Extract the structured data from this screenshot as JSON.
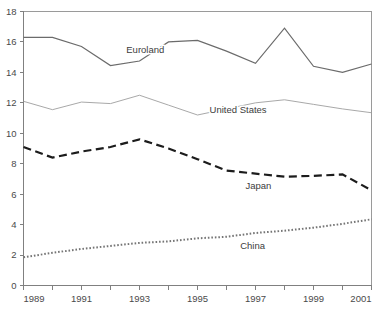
{
  "chart_data": {
    "type": "line",
    "title": "",
    "subtitle": "",
    "xlabel": "",
    "ylabel": "",
    "x": [
      1989,
      1990,
      1991,
      1992,
      1993,
      1994,
      1995,
      1996,
      1997,
      1998,
      1999,
      2000,
      2001
    ],
    "xlim": [
      1989,
      2001
    ],
    "ylim": [
      0,
      18
    ],
    "ytick_values": [
      0,
      2,
      4,
      6,
      8,
      10,
      12,
      14,
      16,
      18
    ],
    "ytick_labels": [
      "0",
      "2",
      "4",
      "6",
      "8",
      "10",
      "12",
      "14",
      "16",
      "18"
    ],
    "xtick_values": [
      1989,
      1990,
      1991,
      1992,
      1993,
      1994,
      1995,
      1996,
      1997,
      1998,
      1999,
      2000,
      2001
    ],
    "xtick_labels": [
      "1989",
      "",
      "1991",
      "",
      "1993",
      "",
      "1995",
      "",
      "1997",
      "",
      "1999",
      "",
      "2001"
    ],
    "grid": false,
    "legend_position": "inline-annotations",
    "series": [
      {
        "name": "Euroland",
        "style": "solid",
        "color": "#6b6b6b",
        "width": 1.2,
        "label_x": 1993.2,
        "label_y": 15.25,
        "values": [
          16.3,
          16.3,
          15.7,
          14.45,
          14.75,
          16.0,
          16.1,
          15.4,
          14.6,
          16.9,
          14.4,
          14.0,
          14.55
        ]
      },
      {
        "name": "United States",
        "style": "solid",
        "color": "#9e9e9e",
        "width": 0.9,
        "label_x": 1996.4,
        "label_y": 11.35,
        "values": [
          12.1,
          11.55,
          12.05,
          11.95,
          12.5,
          11.85,
          11.2,
          11.6,
          12.0,
          12.2,
          11.9,
          11.6,
          11.35
        ]
      },
      {
        "name": "Japan",
        "style": "dashed",
        "color": "#1c1c1c",
        "width": 2.2,
        "label_x": 1997.1,
        "label_y": 6.35,
        "values": [
          9.1,
          8.4,
          8.8,
          9.1,
          9.6,
          9.0,
          8.3,
          7.55,
          7.35,
          7.15,
          7.2,
          7.3,
          6.25
        ]
      },
      {
        "name": "China",
        "style": "dotted",
        "color": "#757575",
        "width": 2.0,
        "label_x": 1996.9,
        "label_y": 2.4,
        "values": [
          1.85,
          2.15,
          2.4,
          2.6,
          2.8,
          2.9,
          3.1,
          3.2,
          3.45,
          3.6,
          3.8,
          4.05,
          4.35
        ]
      }
    ]
  },
  "axes": {
    "background": "#ffffff",
    "axis_color": "#808080",
    "border_color": "#9a9a9a",
    "tick_label_color": "#4a4a4a"
  }
}
